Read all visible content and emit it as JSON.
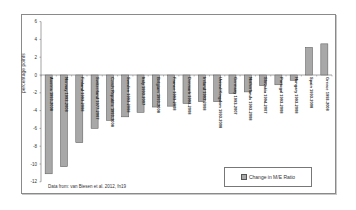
{
  "chart_data": {
    "type": "bar",
    "title": "",
    "xlabel": "",
    "ylabel": "percentage points",
    "ylim": [
      -12,
      6
    ],
    "yticks": [
      6,
      4,
      2,
      0,
      -2,
      -4,
      -6,
      -8,
      -10,
      -12
    ],
    "grid": false,
    "legend_position": "bottom-right inside",
    "categories": [
      "Austria 1993-2008",
      "Norway 1993-2008",
      "Finland 1993-2008",
      "Switzerland 1977-2007",
      "Czech Republic 1993-2008",
      "Sweden 1993-2008",
      "Italy 1993-2007",
      "Belgium 1993-2008",
      "France 1993-2008",
      "Denmark 1993-2008",
      "Ireland 1993-2008",
      "United Kingdom 1993-2008",
      "Germany 1993-2007",
      "Netherlands 1993-2008",
      "Slovakia 1994-2007",
      "Portugal 1993-2008",
      "Hungary 1993-2008",
      "Spain 1993-2008",
      "Greece 1993-2008"
    ],
    "series": [
      {
        "name": "Change in M/E Ratio",
        "color": "#a8a8a8",
        "values": [
          -11.1,
          -10.3,
          -7.6,
          -6.0,
          -5.1,
          -4.7,
          -4.2,
          -3.6,
          -3.5,
          -3.2,
          -3.0,
          -3.0,
          -2.1,
          -1.9,
          -1.2,
          -1.1,
          -0.6,
          3.1,
          3.5
        ]
      }
    ],
    "annotations": [
      "Data from: van Biesen et al. 2012, fn19"
    ]
  },
  "legend": {
    "label": "Change in M/E Ratio"
  },
  "source_note": "Data from: van Biesen et al. 2012, fn19",
  "colors": {
    "bar_fill": "#a8a8a8",
    "bar_stroke": "#555555",
    "axis": "#666666",
    "frame": "#8a8a8a"
  }
}
